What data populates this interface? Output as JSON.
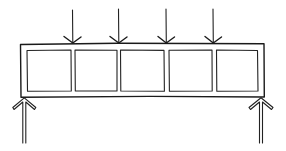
{
  "diagram": {
    "description": "Hand-drawn sketch of a beam/frame with five rectangular cells, four downward point loads on top, and two upward support reactions at the ends",
    "ink_color": "#1a1a1a",
    "background": "#ffffff",
    "beam": {
      "x": 20,
      "y": 44,
      "width": 244,
      "height": 53
    },
    "cells": [
      {
        "x": 27,
        "y": 50,
        "width": 44,
        "height": 41
      },
      {
        "x": 75,
        "y": 50,
        "width": 42,
        "height": 41
      },
      {
        "x": 120,
        "y": 50,
        "width": 44,
        "height": 41
      },
      {
        "x": 169,
        "y": 50,
        "width": 43,
        "height": 41
      },
      {
        "x": 216,
        "y": 50,
        "width": 42,
        "height": 41
      }
    ],
    "loads": [
      {
        "x": 72,
        "y_top": 10,
        "y_tip": 44,
        "direction": "down"
      },
      {
        "x": 118,
        "y_top": 9,
        "y_tip": 44,
        "direction": "down"
      },
      {
        "x": 166,
        "y_top": 9,
        "y_tip": 44,
        "direction": "down"
      },
      {
        "x": 213,
        "y_top": 9,
        "y_tip": 44,
        "direction": "down"
      }
    ],
    "supports": [
      {
        "x": 24,
        "y_tip": 97,
        "y_bottom": 143,
        "direction": "up",
        "style": "hollow"
      },
      {
        "x": 261,
        "y_tip": 97,
        "y_bottom": 143,
        "direction": "up",
        "style": "hollow"
      }
    ]
  }
}
